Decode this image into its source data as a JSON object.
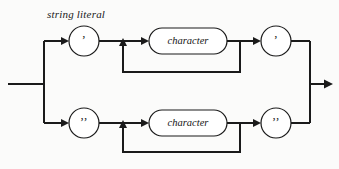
{
  "diagram": {
    "title": "string literal",
    "type": "railroad-syntax-diagram",
    "colors": {
      "background": "#fbfbfa",
      "line": "#1a1a1a",
      "node_fill": "#ffffff",
      "node_stroke": "#1a1a1a",
      "text": "#141414"
    },
    "branches": [
      {
        "id": "single-quoted",
        "open_quote": "’",
        "open_quote_name": "single-quote",
        "terminal_label": "character",
        "close_quote": "’",
        "close_quote_name": "single-quote",
        "has_repeat_loop": true
      },
      {
        "id": "double-quoted",
        "open_quote": "’’",
        "open_quote_name": "double-quote",
        "terminal_label": "character",
        "close_quote": "’’",
        "close_quote_name": "double-quote",
        "has_repeat_loop": true
      }
    ],
    "geometry": {
      "entry_x": 8,
      "entry_y": 84,
      "split_x": 44,
      "merge_x": 310,
      "exit_x": 332,
      "top_rail_y": 41,
      "bottom_rail_y": 123,
      "top_loop_y": 72,
      "bottom_loop_y": 152,
      "circle_radius": 15,
      "top_open_circle_cx": 84,
      "top_close_circle_cx": 276,
      "bottom_open_circle_cx": 84,
      "bottom_close_circle_cx": 276,
      "loop_left_x": 123,
      "loop_right_x": 240,
      "stadium_left": 149,
      "stadium_width": 78,
      "stadium_height": 26
    }
  }
}
